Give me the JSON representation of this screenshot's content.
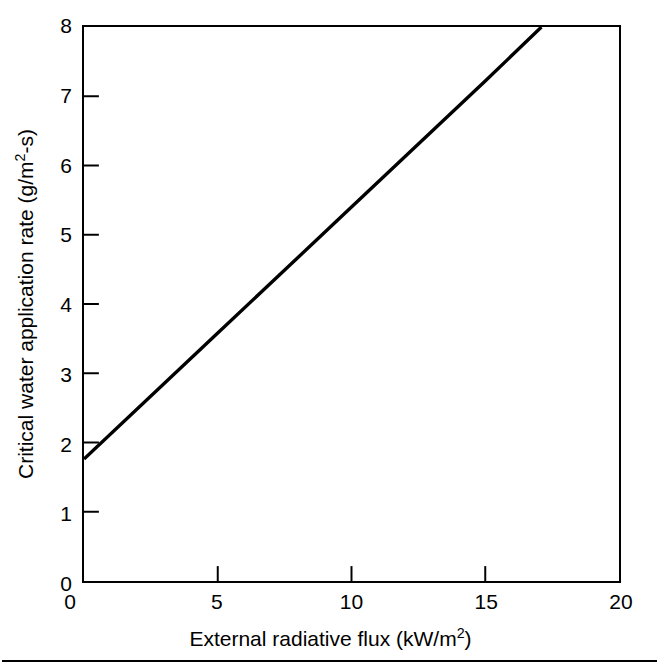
{
  "figure": {
    "background_color": "#ffffff",
    "ink_color": "#000000",
    "bottom_rule": true
  },
  "axes": {
    "x": {
      "title_parts": {
        "before": "External radiative flux (kW/m",
        "sup": "2",
        "after": ")"
      },
      "title_plain": "External radiative flux (kW/m2)",
      "ticks": [
        {
          "value": 0,
          "label": "0",
          "labelled_on_axis": false
        },
        {
          "value": 5,
          "label": "5",
          "labelled_on_axis": true
        },
        {
          "value": 10,
          "label": "10",
          "labelled_on_axis": true
        },
        {
          "value": 15,
          "label": "15",
          "labelled_on_axis": true
        },
        {
          "value": 20,
          "label": "20",
          "labelled_on_axis": true
        }
      ],
      "min": 0,
      "max": 20
    },
    "y": {
      "title_parts": {
        "before": "Critical water application rate (g/m",
        "sup": "2",
        "after": "-s)"
      },
      "title_plain": "Critical water application rate (g/m2-s)",
      "ticks": [
        {
          "value": 0,
          "label": "0"
        },
        {
          "value": 1,
          "label": "1"
        },
        {
          "value": 2,
          "label": "2"
        },
        {
          "value": 3,
          "label": "3"
        },
        {
          "value": 4,
          "label": "4"
        },
        {
          "value": 5,
          "label": "5"
        },
        {
          "value": 6,
          "label": "6"
        },
        {
          "value": 7,
          "label": "7"
        },
        {
          "value": 8,
          "label": "8"
        }
      ],
      "min": 0,
      "max": 8
    }
  },
  "chart_data": {
    "type": "line",
    "title": "",
    "xlabel": "External radiative flux (kW/m2)",
    "ylabel": "Critical water application rate (g/m2-s)",
    "xlim": [
      0,
      20
    ],
    "ylim": [
      0,
      8
    ],
    "xticks": [
      0,
      5,
      10,
      15,
      20
    ],
    "yticks": [
      0,
      1,
      2,
      3,
      4,
      5,
      6,
      7,
      8
    ],
    "grid": false,
    "legend": null,
    "series": [
      {
        "name": "Critical water application rate",
        "color": "#000000",
        "line_width": 3,
        "x": [
          0,
          5,
          10,
          15,
          17.1
        ],
        "y": [
          1.76,
          3.58,
          5.4,
          7.22,
          8.0
        ],
        "fit": {
          "intercept": 1.76,
          "slope": 0.365
        }
      }
    ],
    "annotations": []
  }
}
